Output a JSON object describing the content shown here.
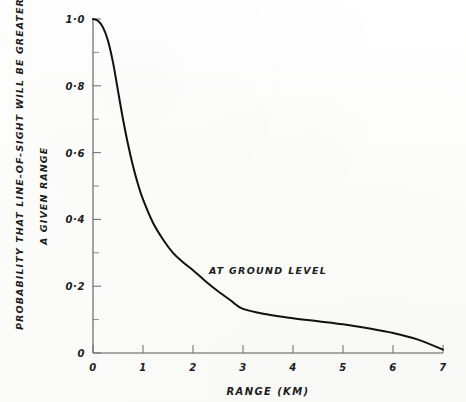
{
  "figure": {
    "background_color": "#fdfdfc",
    "ink_color": "#111111",
    "axis_color": "#5a5a5a"
  },
  "chart_data": {
    "type": "line",
    "title": "",
    "subtitle": "",
    "xlabel": "RANGE (KM)",
    "ylabel_line1": "PROBABILITY THAT LINE-OF-SIGHT WILL BE GREATER THAN",
    "ylabel_line2": "A GIVEN RANGE",
    "annotation": "AT GROUND LEVEL",
    "grid": false,
    "legend": "none",
    "xlim": [
      0,
      7
    ],
    "ylim": [
      0,
      1.0
    ],
    "xticks": [
      0,
      1,
      2,
      3,
      4,
      5,
      6,
      7
    ],
    "xtick_labels": [
      "0",
      "1",
      "2",
      "3",
      "4",
      "5",
      "6",
      "7"
    ],
    "yticks": [
      0,
      0.2,
      0.4,
      0.6,
      0.8,
      1.0
    ],
    "ytick_labels": [
      "0",
      "0·2",
      "0·4",
      "0·6",
      "0·8",
      "1·0"
    ],
    "yticks_minor": [
      0.1,
      0.3,
      0.5,
      0.7,
      0.9
    ],
    "series": [
      {
        "name": "at ground level",
        "x": [
          0.0,
          0.1,
          0.2,
          0.3,
          0.4,
          0.5,
          0.6,
          0.7,
          0.8,
          0.9,
          1.0,
          1.2,
          1.4,
          1.6,
          1.8,
          2.0,
          2.25,
          2.5,
          2.75,
          3.0,
          3.5,
          4.0,
          4.5,
          5.0,
          5.5,
          6.0,
          6.5,
          7.0
        ],
        "y": [
          1.0,
          0.995,
          0.975,
          0.935,
          0.87,
          0.785,
          0.7,
          0.625,
          0.56,
          0.505,
          0.46,
          0.39,
          0.34,
          0.3,
          0.272,
          0.248,
          0.215,
          0.185,
          0.158,
          0.132,
          0.115,
          0.104,
          0.095,
          0.086,
          0.074,
          0.06,
          0.04,
          0.01
        ]
      }
    ]
  }
}
